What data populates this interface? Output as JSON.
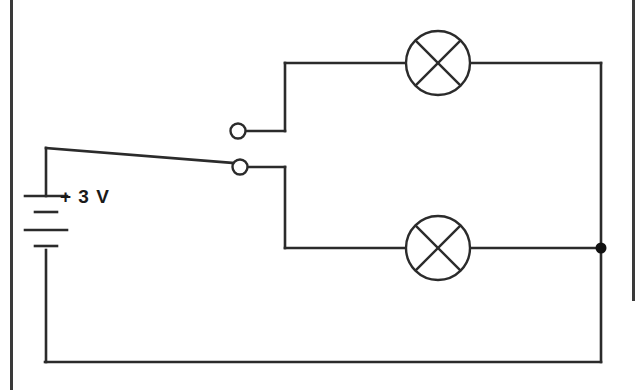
{
  "diagram": {
    "type": "electrical-circuit-schematic",
    "background_color": "#ffffff",
    "wire_color": "#2b2b2b",
    "border_color": "#3a3a3a"
  },
  "battery": {
    "label": "+ 3 V",
    "voltage_value": "3",
    "voltage_unit": "V",
    "polarity_sign": "+",
    "cells": 2,
    "plates": 4
  },
  "switch": {
    "name": "single-pole-switch",
    "state": "closed-lower",
    "contacts": [
      {
        "id": "upper-contact",
        "position": "top"
      },
      {
        "id": "lower-contact",
        "position": "bottom"
      }
    ]
  },
  "lamps": [
    {
      "id": "lamp-upper",
      "symbol": "circle-with-x",
      "branch": "top-branch"
    },
    {
      "id": "lamp-lower",
      "symbol": "circle-with-x",
      "branch": "bottom-branch"
    }
  ],
  "junctions": [
    {
      "id": "right-junction-node",
      "type": "solid-dot"
    }
  ]
}
